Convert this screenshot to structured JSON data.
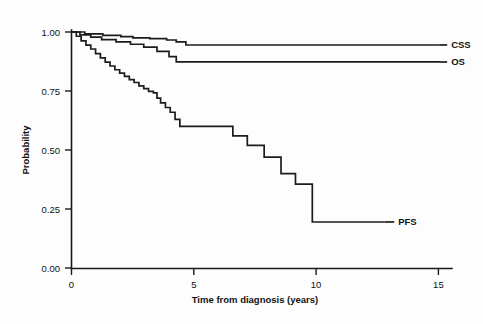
{
  "figure": {
    "background_color": "#fdfdfd",
    "line_color": "#1c1c1c",
    "width": 483,
    "height": 324
  },
  "chart_data": {
    "type": "line",
    "subtype": "kaplan-meier-step",
    "title": "",
    "subtitle": "",
    "xlabel": "Time from diagnosis (years)",
    "ylabel": "Probability",
    "xlim": [
      0,
      15.8
    ],
    "ylim": [
      0.0,
      1.0
    ],
    "xticks": [
      0,
      5,
      10,
      15
    ],
    "xtick_labels": [
      "0",
      "5",
      "10",
      "15"
    ],
    "yticks": [
      0.0,
      0.25,
      0.5,
      0.75,
      1.0
    ],
    "ytick_labels": [
      "0.00",
      "0.25",
      "0.50",
      "0.75",
      "1.00"
    ],
    "grid": false,
    "legend_position": "right-inline-labels",
    "legend_entries": [
      "CSS",
      "OS",
      "PFS"
    ],
    "annotations": [
      {
        "text": "CSS",
        "x": 15.6,
        "y": 0.945
      },
      {
        "text": "OS",
        "x": 15.6,
        "y": 0.873
      },
      {
        "text": "PFS",
        "x": 13.4,
        "y": 0.195
      }
    ],
    "series": [
      {
        "name": "CSS",
        "label": "CSS",
        "end_probability": 0.945,
        "max_time": 15.3,
        "x": [
          0.0,
          0.55,
          0.55,
          1.3,
          1.3,
          2.05,
          2.05,
          2.55,
          2.55,
          3.25,
          3.25,
          3.95,
          3.95,
          4.35,
          4.35,
          4.75,
          4.75,
          15.3
        ],
        "y": [
          1.0,
          1.0,
          0.992,
          0.992,
          0.986,
          0.986,
          0.98,
          0.98,
          0.975,
          0.975,
          0.972,
          0.972,
          0.966,
          0.966,
          0.958,
          0.958,
          0.945,
          0.945
        ]
      },
      {
        "name": "OS",
        "label": "OS",
        "end_probability": 0.873,
        "max_time": 15.3,
        "x": [
          0.0,
          0.35,
          0.35,
          0.8,
          0.8,
          1.25,
          1.25,
          1.85,
          1.85,
          2.45,
          2.45,
          3.0,
          3.0,
          3.55,
          3.55,
          4.05,
          4.05,
          4.35,
          4.35,
          15.3
        ],
        "y": [
          1.0,
          1.0,
          0.988,
          0.988,
          0.978,
          0.978,
          0.968,
          0.968,
          0.958,
          0.958,
          0.948,
          0.948,
          0.936,
          0.936,
          0.918,
          0.918,
          0.896,
          0.896,
          0.873,
          0.873
        ]
      },
      {
        "name": "PFS",
        "label": "PFS",
        "end_probability": 0.195,
        "max_time": 13.0,
        "x": [
          0.0,
          0.2,
          0.2,
          0.4,
          0.4,
          0.6,
          0.6,
          0.8,
          0.8,
          1.0,
          1.0,
          1.2,
          1.2,
          1.4,
          1.4,
          1.6,
          1.6,
          1.8,
          1.8,
          2.0,
          2.0,
          2.2,
          2.2,
          2.4,
          2.4,
          2.6,
          2.6,
          2.8,
          2.8,
          3.0,
          3.0,
          3.2,
          3.2,
          3.4,
          3.4,
          3.55,
          3.55,
          3.7,
          3.7,
          3.9,
          3.9,
          4.1,
          4.1,
          4.3,
          4.3,
          4.5,
          4.5,
          6.7,
          6.7,
          7.3,
          7.3,
          8.0,
          8.0,
          8.7,
          8.7,
          9.3,
          9.3,
          10.0,
          10.0,
          13.0
        ],
        "y": [
          1.0,
          1.0,
          0.982,
          0.982,
          0.962,
          0.962,
          0.944,
          0.944,
          0.928,
          0.928,
          0.908,
          0.908,
          0.89,
          0.89,
          0.872,
          0.872,
          0.856,
          0.856,
          0.84,
          0.84,
          0.826,
          0.826,
          0.812,
          0.812,
          0.798,
          0.798,
          0.786,
          0.786,
          0.772,
          0.772,
          0.76,
          0.76,
          0.748,
          0.748,
          0.742,
          0.742,
          0.72,
          0.72,
          0.7,
          0.7,
          0.68,
          0.68,
          0.66,
          0.66,
          0.63,
          0.63,
          0.6,
          0.6,
          0.56,
          0.56,
          0.52,
          0.52,
          0.47,
          0.47,
          0.4,
          0.4,
          0.355,
          0.355,
          0.195,
          0.195
        ]
      }
    ]
  }
}
